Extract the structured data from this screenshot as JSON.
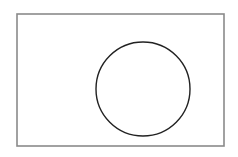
{
  "diagram": {
    "type": "venn",
    "background": "#ffffff",
    "universe": {
      "shape": "rectangle",
      "x": 17,
      "y": 14,
      "width": 207,
      "height": 132,
      "stroke": "#8a8a8a",
      "stroke_width": 1.6
    },
    "sets": [
      {
        "shape": "circle",
        "cx": 143,
        "cy": 89,
        "r": 47,
        "stroke": "#222222",
        "stroke_width": 1.4,
        "fill": "none"
      }
    ]
  }
}
